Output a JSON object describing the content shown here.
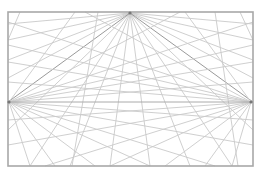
{
  "diagram": {
    "type": "three-point perspective construction",
    "canvas": {
      "width": 262,
      "height": 174,
      "background": "#ffffff"
    },
    "frame": {
      "x": 8,
      "y": 12,
      "width": 245,
      "height": 154,
      "stroke": "#a8a8a8"
    },
    "horizon_line": {
      "y": 102,
      "x1": 8,
      "x2": 253
    },
    "vanishing_points": [
      {
        "id": "top",
        "x": 130,
        "y": 13
      },
      {
        "id": "left",
        "x": 9,
        "y": 102
      },
      {
        "id": "right",
        "x": 251,
        "y": 102
      }
    ],
    "rays": {
      "top": [
        [
          8,
          24
        ],
        [
          8,
          40
        ],
        [
          8,
          60
        ],
        [
          8,
          78
        ],
        [
          8,
          130
        ],
        [
          30,
          166
        ],
        [
          70,
          166
        ],
        [
          110,
          166
        ],
        [
          150,
          166
        ],
        [
          190,
          166
        ],
        [
          232,
          166
        ],
        [
          253,
          130
        ],
        [
          253,
          78
        ],
        [
          253,
          60
        ],
        [
          253,
          40
        ],
        [
          253,
          24
        ]
      ],
      "top_dark": [
        [
          8,
          102
        ],
        [
          253,
          102
        ]
      ],
      "left": [
        [
          75,
          12
        ],
        [
          180,
          12
        ],
        [
          253,
          22
        ],
        [
          253,
          45
        ],
        [
          253,
          62
        ],
        [
          253,
          82
        ],
        [
          253,
          120
        ],
        [
          253,
          145
        ],
        [
          215,
          166
        ],
        [
          150,
          166
        ],
        [
          95,
          166
        ],
        [
          55,
          166
        ],
        [
          30,
          166
        ]
      ],
      "right": [
        [
          185,
          12
        ],
        [
          85,
          12
        ],
        [
          8,
          22
        ],
        [
          8,
          45
        ],
        [
          8,
          62
        ],
        [
          8,
          82
        ],
        [
          8,
          120
        ],
        [
          8,
          145
        ],
        [
          45,
          166
        ],
        [
          110,
          166
        ],
        [
          165,
          166
        ],
        [
          205,
          166
        ],
        [
          232,
          166
        ]
      ],
      "extra": [
        [
          [
            98,
            12
          ],
          [
            72,
            166
          ]
        ],
        [
          [
            20,
            12
          ],
          [
            8,
            40
          ]
        ],
        [
          [
            215,
            12
          ],
          [
            238,
            166
          ]
        ],
        [
          [
            240,
            12
          ],
          [
            253,
            40
          ]
        ]
      ]
    }
  }
}
